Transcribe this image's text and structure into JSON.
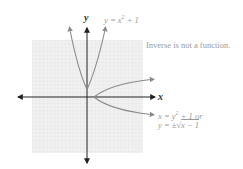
{
  "figure": {
    "axes": {
      "x_label": "x",
      "y_label": "y"
    },
    "curves": [
      {
        "name": "original-function",
        "label_prefix": "y = x",
        "label_exp": "2",
        "label_suffix": " + 1",
        "equation": "y = x^2 + 1"
      },
      {
        "name": "inverse-relation",
        "label_line1_prefix": "x = y",
        "label_line1_exp": "2",
        "label_line1_suffix": " + 1 or",
        "label_line2_prefix": "y = ±",
        "label_line2_radical": "√",
        "label_line2_radicand": "x − 1",
        "equation": "x = y^2 + 1"
      }
    ],
    "note": "Inverse is not a function.",
    "colors": {
      "grid_bg": "#ececec",
      "grid_line": "#dcdcdc",
      "curve": "#8a8a8a",
      "axis": "#222222",
      "label": "#9a9a9a"
    }
  }
}
